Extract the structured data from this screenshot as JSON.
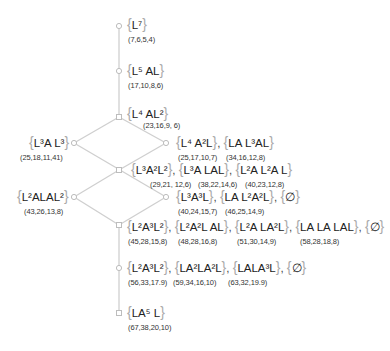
{
  "diagram": {
    "type": "hasse-lattice",
    "edge_color": "#cfcfcf",
    "node_color": "#bdbdbd",
    "nodes": [
      {
        "id": "n1",
        "x": 119,
        "y": 26
      },
      {
        "id": "n2",
        "x": 119,
        "y": 71
      },
      {
        "id": "n3",
        "x": 119,
        "y": 117
      },
      {
        "id": "n4l",
        "x": 74,
        "y": 143
      },
      {
        "id": "n4r",
        "x": 166,
        "y": 143
      },
      {
        "id": "n5",
        "x": 119,
        "y": 170
      },
      {
        "id": "n6l",
        "x": 74,
        "y": 197
      },
      {
        "id": "n6r",
        "x": 166,
        "y": 197
      },
      {
        "id": "n7",
        "x": 119,
        "y": 225
      },
      {
        "id": "n8",
        "x": 119,
        "y": 268
      },
      {
        "id": "n9",
        "x": 119,
        "y": 313
      }
    ],
    "edges": [
      [
        "n1",
        "n2"
      ],
      [
        "n2",
        "n3"
      ],
      [
        "n3",
        "n4l"
      ],
      [
        "n3",
        "n4r"
      ],
      [
        "n4l",
        "n5"
      ],
      [
        "n4r",
        "n5"
      ],
      [
        "n4l",
        "n6r"
      ],
      [
        "n5",
        "n6l"
      ],
      [
        "n5",
        "n6r"
      ],
      [
        "n6l",
        "n7"
      ],
      [
        "n6r",
        "n7"
      ],
      [
        "n7",
        "n8"
      ],
      [
        "n8",
        "n9"
      ]
    ]
  },
  "levels": [
    {
      "words": [
        {
          "base": "L",
          "sup": "7",
          "tail": ""
        }
      ],
      "coords": [
        "(7,6,5,4)"
      ]
    },
    {
      "words": [
        {
          "base": "L",
          "sup": "5",
          "tail": " AL"
        }
      ],
      "coords": [
        "(17,10,8,6)"
      ]
    },
    {
      "words": [
        {
          "base": "L",
          "sup": "4",
          "tail": " AL",
          "sup2": "2"
        }
      ],
      "coords": [
        "(23,16,9,6)"
      ]
    },
    {
      "left": {
        "text": "L³A L³",
        "coord": "(25,18,11,41)"
      },
      "right": [
        {
          "text": "L⁴ A²L",
          "coord": "(25,17,10,7)"
        },
        {
          "text": "LA L³AL",
          "coord": "(34,16,12,8)"
        }
      ]
    },
    {
      "items": [
        {
          "text": "L³A²L²",
          "coord": "(29,21,12,6)"
        },
        {
          "text": "L³A LAL",
          "coord": "(38,22,14,6)"
        },
        {
          "text": "L²A L²A L",
          "coord": "(40,23,12,8)"
        }
      ]
    },
    {
      "left": {
        "text": "L²ALAL²",
        "coord": "(43,26,13,8)"
      },
      "right": [
        {
          "text": "L³A³L",
          "coord": "(40,24,15,7)"
        },
        {
          "text": "LA L²A²L",
          "coord": "(46,25,14,9)"
        },
        {
          "text": "∅",
          "coord": ""
        }
      ]
    },
    {
      "items": [
        {
          "text": "L²A³L²",
          "coord": "(45,28,15,8)"
        },
        {
          "text": "L²A²L AL",
          "coord": "(48,28,16,8)"
        },
        {
          "text": "L²A LA²L",
          "coord": "(51,30,14,9)"
        },
        {
          "text": "LA LA LAL",
          "coord": "(58,28,18,8)"
        },
        {
          "text": "∅",
          "coord": ""
        }
      ]
    },
    {
      "items": [
        {
          "text": "L²A³L²",
          "coord": "(56,33,17,9)"
        },
        {
          "text": "LA²LA²L",
          "coord": "(59,34,16,10)"
        },
        {
          "text": "LALA³L",
          "coord": "(63,32,19,9)"
        },
        {
          "text": "∅",
          "coord": ""
        }
      ]
    },
    {
      "words": [
        {
          "text": "LA⁵ L"
        }
      ],
      "coords": [
        "(67,38,20,10)"
      ]
    }
  ],
  "labels": {
    "l1": "L⁷",
    "c1": "(7,6,5,4)",
    "l2": "L⁵ AL",
    "c2": "(17,10,8,6)",
    "l3": "L⁴ AL²",
    "c3": "(23,16,9, 6)",
    "l4a": "L³A L³",
    "c4a": "(25,18,11,41)",
    "l4b": "L⁴ A²L",
    "c4b": "(25,17,10,7)",
    "l4c": "LA L³AL",
    "c4c": "(34,16,12,8)",
    "l5a": "L³A²L²",
    "c5a": "(29,21, 12,6)",
    "l5b": "L³A LAL",
    "c5b": "(38,22,14,6)",
    "l5c": "L²A L²A L",
    "c5c": "(40,23,12,8)",
    "l6a": "L²ALAL²",
    "c6a": "(43,26,13,8)",
    "l6b": "L³A³L",
    "c6b": "(40,24,15,7)",
    "l6c": "LA L²A²L",
    "c6c": "(46,25,14,9)",
    "l6d": "∅",
    "l7a": "L²A³L²",
    "c7a": "(45,28,15,8)",
    "l7b": "L²A²L AL",
    "c7b": "(48,28,16,8)",
    "l7c": "L²A LA²L",
    "c7c": "(51,30,14,9)",
    "l7d": "LA LA LAL",
    "c7d": "(58,28,18,8)",
    "l7e": "∅",
    "l8a": "L²A³L²",
    "c8a": "(56,33,17.9)",
    "l8b": "LA²LA²L",
    "c8b": "(59,34,16,10)",
    "l8c": "LALA³L",
    "c8c": "(63,32,19.9)",
    "l8d": "∅",
    "l9": "LA⁵ L",
    "c9": "(67,38,20,10)",
    "comma": ","
  }
}
